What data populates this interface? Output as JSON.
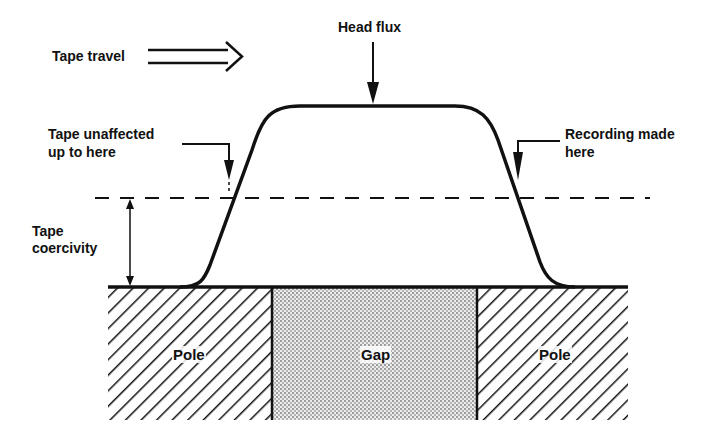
{
  "labels": {
    "tape_travel": "Tape travel",
    "head_flux": "Head flux",
    "tape_unaffected_line1": "Tape unaffected",
    "tape_unaffected_line2": "up to here",
    "recording_made_line1": "Recording made",
    "recording_made_line2": "here",
    "tape_coercivity_line1": "Tape",
    "tape_coercivity_line2": "coercivity"
  },
  "regions": {
    "left_pole": "Pole",
    "gap": "Gap",
    "right_pole": "Pole"
  },
  "colors": {
    "ink": "#111111",
    "background": "#ffffff",
    "gap_fill": "#d9d9d9"
  }
}
